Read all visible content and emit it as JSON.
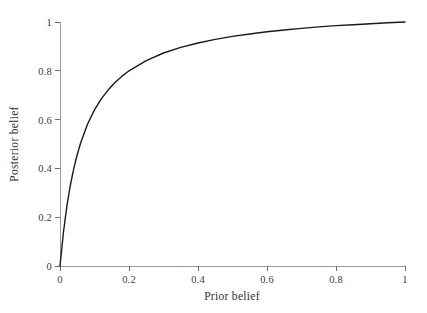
{
  "chart_data": {
    "type": "line",
    "title": "",
    "xlabel": "Prior belief",
    "ylabel": "Posterior belief",
    "xlim": [
      0,
      1
    ],
    "ylim": [
      0,
      1
    ],
    "grid": false,
    "legend": "none",
    "xticks": [
      "0",
      "0.2",
      "0.4",
      "0.6",
      "0.8",
      "1"
    ],
    "xtick_values": [
      0,
      0.2,
      0.4,
      0.6,
      0.8,
      1
    ],
    "yticks": [
      "0",
      "0.2",
      "0.4",
      "0.6",
      "0.8",
      "1"
    ],
    "ytick_values": [
      0,
      0.2,
      0.4,
      0.6,
      0.8,
      1
    ],
    "series": [
      {
        "name": "Posterior belief",
        "color": "#1a1a1a",
        "linewidth": 1.4,
        "x": [
          0,
          0.01,
          0.02,
          0.03,
          0.04,
          0.05,
          0.06,
          0.08,
          0.1,
          0.12,
          0.14,
          0.16,
          0.18,
          0.2,
          0.25,
          0.3,
          0.35,
          0.4,
          0.45,
          0.5,
          0.55,
          0.6,
          0.65,
          0.7,
          0.75,
          0.8,
          0.85,
          0.9,
          0.95,
          1
        ],
        "y": [
          0,
          0.139,
          0.246,
          0.331,
          0.4,
          0.457,
          0.505,
          0.582,
          0.64,
          0.686,
          0.722,
          0.753,
          0.778,
          0.8,
          0.842,
          0.873,
          0.896,
          0.914,
          0.929,
          0.941,
          0.951,
          0.96,
          0.967,
          0.974,
          0.98,
          0.985,
          0.989,
          0.993,
          0.997,
          1
        ],
        "formula_note": "posterior = 16p / (16p + (1 - p))"
      }
    ],
    "axis": {
      "line_color": "#9a9a9a",
      "tick_color": "#6f6f6f",
      "label_color": "#3a3a3a"
    }
  },
  "figure": {
    "background": "#ffffff",
    "plot_left_px": 60,
    "plot_right_px": 405,
    "plot_top_px": 22,
    "plot_bottom_px": 266
  }
}
